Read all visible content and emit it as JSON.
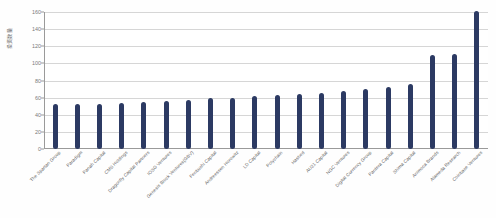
{
  "chart_data": {
    "type": "bar",
    "title": "",
    "subtitle": "",
    "xlabel": "",
    "ylabel": "投资数量",
    "ylim": [
      0,
      160
    ],
    "yticks": [
      0,
      20,
      40,
      60,
      80,
      100,
      120,
      140,
      160
    ],
    "grid": true,
    "legend": false,
    "legend_position": "none",
    "categories": [
      "The Spartan Group",
      "Paradigm",
      "Panah Capital",
      "CMS Holdings",
      "Dragonfly Capital Partners",
      "IOSG Ventures",
      "Genesis Block Ventures(GBV)",
      "Fenbushi Capital",
      "Andreessen Horowitz",
      "LD Capital",
      "Polychain",
      "Hashed",
      "AU21 Capital",
      "NGC Ventures",
      "Digital Currency Group",
      "Pantera Capital",
      "Shima Capital",
      "Animoca Brands",
      "Alameda Research",
      "Coinbase Ventures"
    ],
    "values": [
      52,
      52,
      53,
      54,
      55,
      56,
      57,
      59,
      60,
      62,
      63,
      64,
      66,
      68,
      70,
      73,
      76,
      110,
      111,
      161
    ],
    "series": [
      {
        "name": "投资数量",
        "values": [
          52,
          52,
          53,
          54,
          55,
          56,
          57,
          59,
          60,
          62,
          63,
          64,
          66,
          68,
          70,
          73,
          76,
          110,
          111,
          161
        ]
      }
    ],
    "bar_color": "#2c3a63",
    "grid_color": "#d6d6d6",
    "axis_color": "#9a9a9a",
    "background": "#ffffff"
  }
}
